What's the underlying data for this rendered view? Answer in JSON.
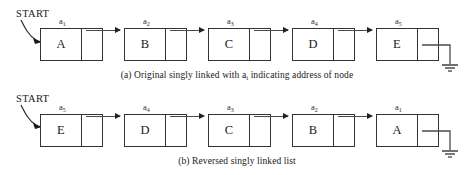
{
  "figure": {
    "start_label": "START",
    "colors": {
      "background": "#ffffff",
      "stroke": "#333333",
      "arrow": "#4a4a4a",
      "text": "#1a1a1a"
    }
  },
  "diagrams": [
    {
      "id": "a",
      "caption_prefix": "(a) Original singly linked with ",
      "caption_var": "a",
      "caption_sub": "i",
      "caption_suffix": " indicating address of node",
      "caption_full": "(a) Original singly linked with ai indicating address of node",
      "start_label": "START",
      "terminator": "ground",
      "nodes": [
        {
          "data": "A",
          "address": "a",
          "address_sub": "1",
          "address_label": "a1"
        },
        {
          "data": "B",
          "address": "a",
          "address_sub": "2",
          "address_label": "a2"
        },
        {
          "data": "C",
          "address": "a",
          "address_sub": "3",
          "address_label": "a3"
        },
        {
          "data": "D",
          "address": "a",
          "address_sub": "4",
          "address_label": "a4"
        },
        {
          "data": "E",
          "address": "a",
          "address_sub": "5",
          "address_label": "a5"
        }
      ]
    },
    {
      "id": "b",
      "caption_prefix": "(b) Reversed singly linked list",
      "caption_var": "",
      "caption_sub": "",
      "caption_suffix": "",
      "caption_full": "(b) Reversed singly linked list",
      "start_label": "START",
      "terminator": "ground",
      "nodes": [
        {
          "data": "E",
          "address": "a",
          "address_sub": "5",
          "address_label": "a5"
        },
        {
          "data": "D",
          "address": "a",
          "address_sub": "4",
          "address_label": "a4"
        },
        {
          "data": "C",
          "address": "a",
          "address_sub": "3",
          "address_label": "a3"
        },
        {
          "data": "B",
          "address": "a",
          "address_sub": "2",
          "address_label": "a2"
        },
        {
          "data": "A",
          "address": "a",
          "address_sub": "1",
          "address_label": "a1"
        }
      ]
    }
  ]
}
